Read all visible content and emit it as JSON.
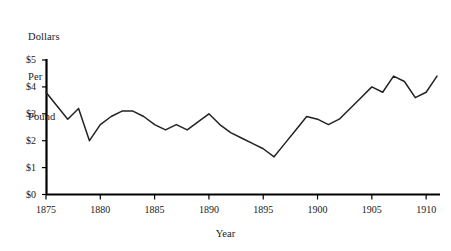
{
  "chart_data": {
    "type": "line",
    "title": "",
    "xlabel": "Year",
    "ylabel": "Dollars Per Pound",
    "ylabel_lines": [
      "Dollars",
      "Per",
      "Pound"
    ],
    "xlim": [
      1875,
      1911
    ],
    "ylim": [
      0,
      5
    ],
    "grid": false,
    "legend": null,
    "y_ticks": [
      0,
      1,
      2,
      3,
      4,
      5
    ],
    "y_tick_labels": [
      "$0",
      "$1",
      "$2",
      "$3",
      "$4",
      "$5"
    ],
    "x_ticks": [
      1875,
      1880,
      1885,
      1890,
      1895,
      1900,
      1905,
      1910
    ],
    "x_tick_labels": [
      "1875",
      "1880",
      "1885",
      "1890",
      "1895",
      "1900",
      "1905",
      "1910"
    ],
    "x": [
      1875,
      1876,
      1877,
      1878,
      1879,
      1880,
      1881,
      1882,
      1883,
      1884,
      1885,
      1886,
      1887,
      1888,
      1889,
      1890,
      1891,
      1892,
      1893,
      1894,
      1895,
      1896,
      1897,
      1898,
      1899,
      1900,
      1901,
      1902,
      1903,
      1904,
      1905,
      1906,
      1907,
      1908,
      1909,
      1910,
      1911
    ],
    "values": [
      3.8,
      3.3,
      2.8,
      3.2,
      2.0,
      2.6,
      2.9,
      3.1,
      3.1,
      2.9,
      2.6,
      2.4,
      2.6,
      2.4,
      2.7,
      3.0,
      2.6,
      2.3,
      2.1,
      1.9,
      1.7,
      1.4,
      1.9,
      2.4,
      2.9,
      2.8,
      2.6,
      2.8,
      3.2,
      3.6,
      4.0,
      3.8,
      4.4,
      4.2,
      3.6,
      3.8,
      4.4
    ],
    "series_name": "Price",
    "line_color": "#222222",
    "axis_color": "#000000"
  }
}
